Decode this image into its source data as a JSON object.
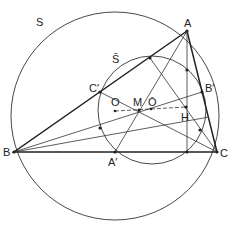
{
  "diagram": {
    "colors": {
      "line": "#222222",
      "background": "#ffffff"
    },
    "labels": {
      "S": "S",
      "S_bar": "S̄",
      "A": "A",
      "B": "B",
      "C": "C",
      "A_prime": "A′",
      "B_prime": "B′",
      "C_prime": "C′",
      "O": "O",
      "M": "M",
      "O_bar": "Ō",
      "H": "H"
    },
    "points": {
      "A": [
        187,
        31
      ],
      "B": [
        14,
        152
      ],
      "C": [
        217,
        152
      ],
      "O": [
        115,
        111
      ],
      "M": [
        139,
        110
      ],
      "O_bar": [
        151,
        109
      ],
      "H": [
        186,
        107
      ]
    }
  }
}
